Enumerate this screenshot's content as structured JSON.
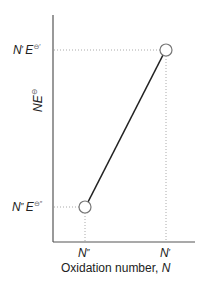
{
  "diagram": {
    "type": "frost-diagram-segment",
    "y_axis": {
      "label_main": "NE",
      "label_sup": "⊖"
    },
    "x_axis": {
      "label": "Oxidation number, ",
      "label_var": "N"
    },
    "x_ticks": [
      {
        "label_main": "N",
        "label_prime": "″"
      },
      {
        "label_main": "N",
        "label_prime": "′"
      }
    ],
    "y_ticks": [
      {
        "label_n": "N",
        "label_n_prime": "′",
        "label_e": "E",
        "label_sup": "⊖′"
      },
      {
        "label_n": "N",
        "label_n_prime": "″",
        "label_e": "E",
        "label_sup": "⊖″"
      }
    ],
    "points": [
      {
        "name": "lower",
        "x_label": "N″",
        "y_label": "N″E⊖″"
      },
      {
        "name": "upper",
        "x_label": "N′",
        "y_label": "N′E⊖′"
      }
    ],
    "colors": {
      "axis": "#555555",
      "line": "#222222",
      "guide": "#aaaaaa",
      "marker_fill": "#ffffff",
      "marker_stroke": "#777777"
    }
  }
}
